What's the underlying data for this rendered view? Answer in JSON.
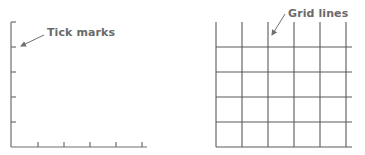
{
  "left_panel": {
    "title": "Tick marks",
    "y_tick_count": 5,
    "x_tick_count": 5
  },
  "right_panel": {
    "title": "Grid lines",
    "vertical_line_count": 6,
    "horizontal_line_count": 5
  },
  "colors": {
    "line": "#5a5a5a",
    "axis": "#6e6e6e",
    "label": "#6a6a6a"
  }
}
